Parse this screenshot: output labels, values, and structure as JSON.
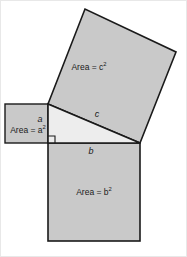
{
  "figure": {
    "background_color": "#ffffff",
    "border_color": "#e3e3e3",
    "square_fill": "#c9c9c9",
    "triangle_fill": "#ededed",
    "stroke_color": "#1a1a1a"
  },
  "labels": {
    "area_c": "Area = c",
    "area_a": "Area = a",
    "area_b": "Area = b",
    "exponent": "2",
    "side_a": "a",
    "side_b": "b",
    "side_c": "c"
  },
  "geometry": {
    "triangle": {
      "vertex_apex": [
        48,
        104
      ],
      "vertex_right_angle": [
        140,
        143
      ],
      "vertex_left": [
        48,
        143
      ],
      "right_angle_marker_size": 7
    },
    "square_a": {
      "x": 5,
      "y": 104,
      "width": 43,
      "height": 39
    },
    "square_b": {
      "x": 48,
      "y": 143,
      "width": 92,
      "height": 98
    },
    "square_c": {
      "points": "48,104 85,9 176,52 140,143"
    }
  }
}
